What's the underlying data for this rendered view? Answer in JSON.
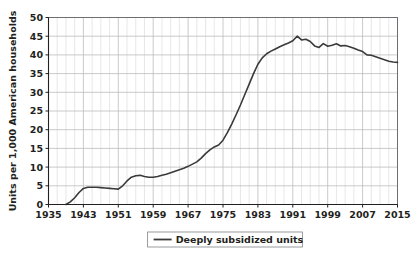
{
  "chart_data": {
    "type": "line",
    "title": "",
    "subtitle": "",
    "xlabel": "",
    "ylabel": "Units per 1,000 American households",
    "xlim": [
      1935,
      2015
    ],
    "ylim": [
      0,
      50
    ],
    "grid": true,
    "legend_position": "bottom-center",
    "xticks": [
      1935,
      1943,
      1951,
      1959,
      1967,
      1975,
      1983,
      1991,
      1999,
      2007,
      2015
    ],
    "xtick_labels": [
      "1935",
      "1943",
      "1951",
      "1959",
      "1967",
      "1975",
      "1983",
      "1991",
      "1999",
      "2007",
      "2015"
    ],
    "x_minor_step": 2,
    "yticks": [
      0,
      5,
      10,
      15,
      20,
      25,
      30,
      35,
      40,
      45,
      50
    ],
    "ytick_labels": [
      "0",
      "5",
      "10",
      "15",
      "20",
      "25",
      "30",
      "35",
      "40",
      "45",
      "50"
    ],
    "series": [
      {
        "name": "Deeply subsidized units",
        "color": "#3a3a3c",
        "x": [
          1939,
          1940,
          1941,
          1942,
          1943,
          1944,
          1945,
          1946,
          1947,
          1948,
          1949,
          1950,
          1951,
          1952,
          1953,
          1954,
          1955,
          1956,
          1957,
          1958,
          1959,
          1960,
          1961,
          1962,
          1963,
          1964,
          1965,
          1966,
          1967,
          1968,
          1969,
          1970,
          1971,
          1972,
          1973,
          1974,
          1975,
          1976,
          1977,
          1978,
          1979,
          1980,
          1981,
          1982,
          1983,
          1984,
          1985,
          1986,
          1987,
          1988,
          1989,
          1990,
          1991,
          1992,
          1993,
          1994,
          1995,
          1996,
          1997,
          1998,
          1999,
          2000,
          2001,
          2002,
          2003,
          2004,
          2005,
          2006,
          2007,
          2008,
          2009,
          2010,
          2011,
          2012,
          2013,
          2014,
          2015
        ],
        "y": [
          0.0,
          0.7,
          1.8,
          3.2,
          4.3,
          4.6,
          4.6,
          4.6,
          4.5,
          4.4,
          4.3,
          4.2,
          4.1,
          5.0,
          6.3,
          7.3,
          7.7,
          7.8,
          7.5,
          7.3,
          7.3,
          7.5,
          7.8,
          8.1,
          8.5,
          8.9,
          9.3,
          9.7,
          10.2,
          10.8,
          11.4,
          12.4,
          13.6,
          14.6,
          15.4,
          15.9,
          17.2,
          19.2,
          21.5,
          24.0,
          26.6,
          29.4,
          32.2,
          35.0,
          37.5,
          39.2,
          40.3,
          41.0,
          41.6,
          42.2,
          42.7,
          43.2,
          43.8,
          45.0,
          44.0,
          44.2,
          43.6,
          42.4,
          42.0,
          43.0,
          42.3,
          42.6,
          43.0,
          42.4,
          42.5,
          42.2,
          41.8,
          41.3,
          40.9,
          40.0,
          39.9,
          39.5,
          39.1,
          38.7,
          38.3,
          38.1,
          38.0
        ]
      }
    ],
    "legend": [
      {
        "label": "Deeply subsidized units",
        "color": "#3a3a3c"
      }
    ]
  },
  "axes": {
    "y_axis_title": "Units per 1,000 American households"
  },
  "colors": {
    "series": "#3a3a3c",
    "grid_minor": "#dddddd",
    "grid_major": "#bcbcbc",
    "frame": "#6d6e71",
    "text": "#231f20",
    "background": "#ffffff"
  }
}
